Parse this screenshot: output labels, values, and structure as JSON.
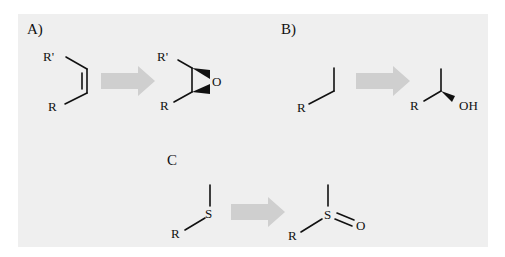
{
  "panel": {
    "background": "#efefef"
  },
  "arrow_color": "#cfcfcf",
  "reactions": [
    {
      "label": "A)",
      "name": "epoxidation",
      "reactant": {
        "atoms": [
          "R'",
          "R"
        ],
        "description": "cis-alkene"
      },
      "product": {
        "atoms": [
          "R'",
          "R",
          "O"
        ],
        "description": "epoxide"
      }
    },
    {
      "label": "B)",
      "name": "hydroxylation",
      "reactant": {
        "atoms": [
          "R"
        ],
        "description": "alkyl chain"
      },
      "product": {
        "atoms": [
          "R",
          "OH"
        ],
        "description": "chiral secondary alcohol"
      }
    },
    {
      "label": "C",
      "name": "sulfoxidation",
      "reactant": {
        "atoms": [
          "R",
          "S"
        ],
        "description": "thioether"
      },
      "product": {
        "atoms": [
          "R",
          "S",
          "O"
        ],
        "description": "sulfoxide"
      }
    }
  ]
}
